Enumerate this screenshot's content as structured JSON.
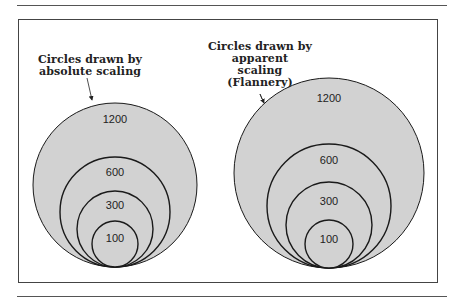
{
  "figure": {
    "left_caption": [
      "Circles drawn by",
      "absolute scaling"
    ],
    "right_caption": [
      "Circles drawn by",
      "apparent",
      "scaling",
      "(Flannery)"
    ],
    "left_circles": [
      {
        "label": "1200",
        "cx": 115,
        "bottom": 267,
        "r": 82,
        "label_y": 119
      },
      {
        "label": "600",
        "cx": 115,
        "bottom": 267,
        "r": 55,
        "label_y": 172
      },
      {
        "label": "300",
        "cx": 115,
        "bottom": 267,
        "r": 38,
        "label_y": 205
      },
      {
        "label": "100",
        "cx": 115,
        "bottom": 267,
        "r": 23,
        "label_y": 238
      }
    ],
    "right_circles": [
      {
        "label": "1200",
        "cx": 329,
        "bottom": 268,
        "r": 95,
        "label_y": 98
      },
      {
        "label": "600",
        "cx": 329,
        "bottom": 268,
        "r": 62,
        "label_y": 160
      },
      {
        "label": "300",
        "cx": 329,
        "bottom": 268,
        "r": 43,
        "label_y": 201
      },
      {
        "label": "100",
        "cx": 329,
        "bottom": 268,
        "r": 24,
        "label_y": 239
      }
    ],
    "fill_color": "#d2d2d2",
    "stroke_color": "#1a1a1a"
  }
}
